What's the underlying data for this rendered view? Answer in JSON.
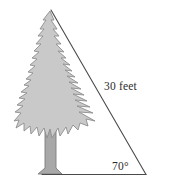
{
  "figure": {
    "background_color": "#ffffff",
    "width": 170,
    "height": 190,
    "labels": {
      "hypotenuse": "30 feet",
      "angle": "70°"
    },
    "colors": {
      "line": "#4a4a4a",
      "tree_fill": "#c9c9c9",
      "tree_outline": "#8d8d8d",
      "trunk_fill": "#a8a8a8",
      "trunk_outline": "#7d7d7d",
      "text": "#2b2b2b"
    },
    "triangle": {
      "apex": [
        51,
        10
      ],
      "bottom_left": [
        51,
        174
      ],
      "bottom_right": [
        146,
        174
      ],
      "hypotenuse_label": "30 feet",
      "angle_label": "70°",
      "angle_vertex": "bottom_right",
      "right_angle_vertex": "bottom_left"
    },
    "tree": {
      "kind": "evergreen-fir",
      "top": [
        50,
        11
      ],
      "base": [
        50,
        175
      ],
      "widest_span": [
        14,
        95
      ]
    },
    "icon_names": {
      "tree": "evergreen-tree-icon",
      "triangle": "right-triangle-icon"
    }
  }
}
